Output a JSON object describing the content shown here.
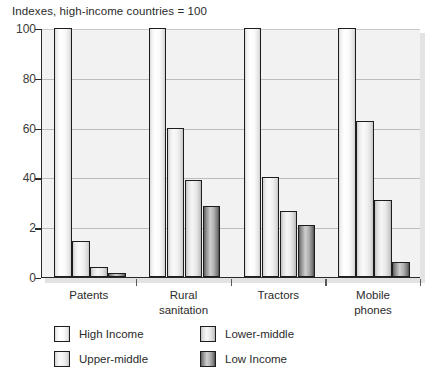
{
  "chart_data": {
    "type": "bar",
    "title": "Indexes, high-income countries = 100",
    "xlabel": "",
    "ylabel": "",
    "ylim": [
      0,
      100
    ],
    "yticks": [
      0,
      20,
      40,
      60,
      80,
      100
    ],
    "ytick_labels": [
      "0",
      "2",
      "40",
      "60",
      "80",
      "100"
    ],
    "grid": true,
    "legend_position": "bottom",
    "categories": [
      "Patents",
      "Rural\nsanitation",
      "Tractors",
      "Mobile\nphones"
    ],
    "series": [
      {
        "name": "High Income",
        "values": [
          100,
          100,
          100,
          100
        ]
      },
      {
        "name": "Upper-middle",
        "values": [
          14.5,
          60,
          40,
          62.5
        ]
      },
      {
        "name": "Lower-middle",
        "values": [
          4,
          39,
          26.5,
          31
        ]
      },
      {
        "name": "Low Income",
        "values": [
          1.5,
          28.5,
          21,
          6
        ]
      }
    ]
  },
  "legend": {
    "entries": [
      {
        "label": "High Income",
        "swatch": "series-0-swatch"
      },
      {
        "label": "Lower-middle",
        "swatch": "series-2-swatch"
      },
      {
        "label": "Upper-middle",
        "swatch": "series-1-swatch"
      },
      {
        "label": "Low Income",
        "swatch": "series-3-swatch"
      }
    ]
  }
}
